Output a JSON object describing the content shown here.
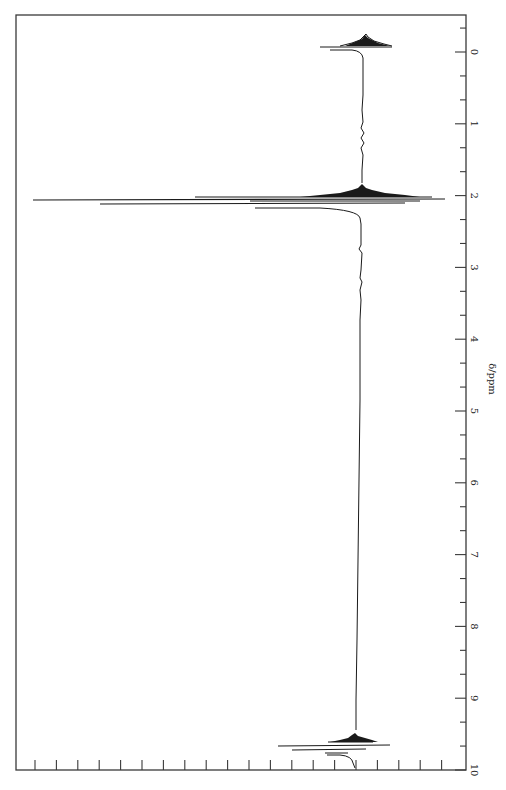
{
  "chart_data": {
    "type": "line",
    "title": "",
    "orientation": "rotated 90 degrees clockwise (chemical shift axis vertical on right, intensity increases leftward)",
    "xlabel": "δ/ppm",
    "ylabel": "",
    "xlim": [
      0,
      10
    ],
    "x_ticks": [
      "0",
      "1",
      "2",
      "3",
      "4",
      "5",
      "6",
      "7",
      "8",
      "9",
      "10"
    ],
    "x_minor_ticks_per_major": 3,
    "intensity_ticks_count": 20,
    "grid": false,
    "series": [
      {
        "name": "1H NMR spectrum",
        "peaks": [
          {
            "shift_ppm": -0.05,
            "relative_height": 0.28,
            "label": "TMS reference",
            "shape": "broad multiplet"
          },
          {
            "shift_ppm": 1.9,
            "relative_height": 0.24,
            "shape": "multiplet base"
          },
          {
            "shift_ppm": 2.08,
            "relative_height": 0.78,
            "shape": "sharp"
          },
          {
            "shift_ppm": 2.12,
            "relative_height": 1.0,
            "shape": "sharp (tallest)"
          },
          {
            "shift_ppm": 2.17,
            "relative_height": 0.78,
            "shape": "sharp"
          },
          {
            "shift_ppm": 9.6,
            "relative_height": 0.12,
            "shape": "multiplet base"
          },
          {
            "shift_ppm": 9.72,
            "relative_height": 0.27,
            "shape": "sharp"
          },
          {
            "shift_ppm": 9.76,
            "relative_height": 0.22,
            "shape": "sharp"
          }
        ]
      },
      {
        "name": "integral trace",
        "steps": [
          {
            "from_ppm": -0.1,
            "to_ppm": 0.15,
            "relative_step": 0.1
          },
          {
            "from_ppm": 1.8,
            "to_ppm": 2.35,
            "relative_step": 0.45
          },
          {
            "from_ppm": 9.55,
            "to_ppm": 9.9,
            "relative_step": 0.08
          }
        ]
      }
    ]
  },
  "axis": {
    "label": "δ/ppm",
    "ticks": [
      {
        "value": 0,
        "label": "0"
      },
      {
        "value": 1,
        "label": "1"
      },
      {
        "value": 2,
        "label": "2"
      },
      {
        "value": 3,
        "label": "3"
      },
      {
        "value": 4,
        "label": "4"
      },
      {
        "value": 5,
        "label": "5"
      },
      {
        "value": 6,
        "label": "6"
      },
      {
        "value": 7,
        "label": "7"
      },
      {
        "value": 8,
        "label": "8"
      },
      {
        "value": 9,
        "label": "9"
      },
      {
        "value": 10,
        "label": "10"
      }
    ]
  },
  "colors": {
    "ink": "#1a1a1a",
    "frame": "#3a3a3a",
    "background": "#ffffff"
  }
}
